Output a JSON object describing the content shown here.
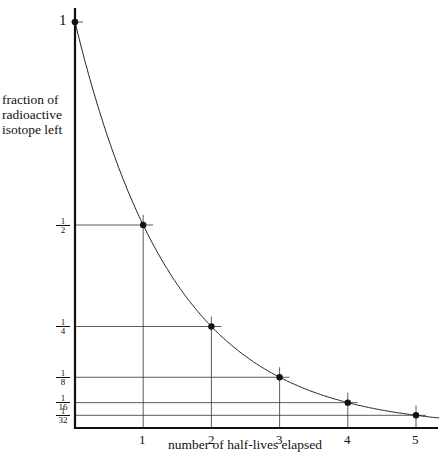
{
  "chart_data": {
    "type": "line",
    "title": "",
    "xlabel": "number of half-lives elapsed",
    "ylabel": "fraction of radioactive isotope left",
    "ylabel_lines": [
      "fraction of",
      "radioactive",
      "isotope left"
    ],
    "x": [
      0,
      1,
      2,
      3,
      4,
      5
    ],
    "values": [
      1,
      0.5,
      0.25,
      0.125,
      0.0625,
      0.03125
    ],
    "series": [
      {
        "name": "decay curve",
        "x": [
          0,
          1,
          2,
          3,
          4,
          5
        ],
        "values": [
          1,
          0.5,
          0.25,
          0.125,
          0.0625,
          0.03125
        ]
      }
    ],
    "x_ticks": [
      "1",
      "2",
      "3",
      "4",
      "5"
    ],
    "y_ticks": [
      {
        "label": "1",
        "value": 1
      },
      {
        "label": "1/2",
        "value": 0.5
      },
      {
        "label": "1/4",
        "value": 0.25
      },
      {
        "label": "1/8",
        "value": 0.125
      },
      {
        "label": "1/16",
        "value": 0.0625
      },
      {
        "label": "1/32",
        "value": 0.03125
      }
    ],
    "xlim": [
      0,
      5.3
    ],
    "ylim": [
      0,
      1
    ],
    "grid": false,
    "legend": null
  },
  "labels": {
    "y_top": "1",
    "fractions": [
      {
        "n": "1",
        "d": "2"
      },
      {
        "n": "1",
        "d": "4"
      },
      {
        "n": "1",
        "d": "8"
      },
      {
        "n": "1",
        "d": "16"
      },
      {
        "n": "1",
        "d": "32"
      }
    ]
  }
}
